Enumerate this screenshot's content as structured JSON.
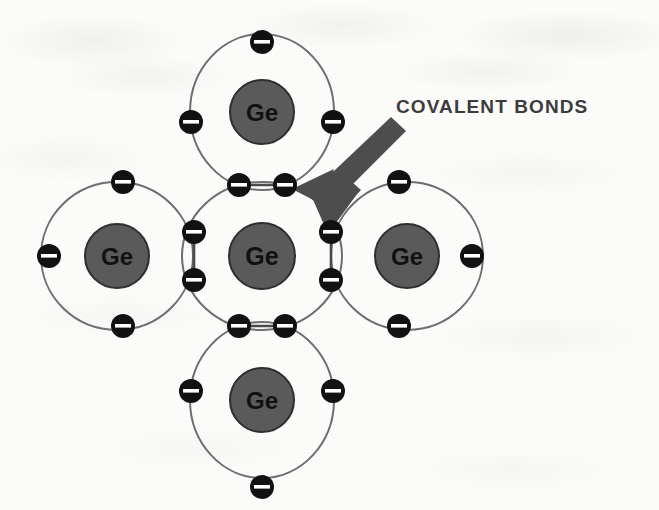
{
  "figure": {
    "annotation_label": "COVALENT BONDS",
    "element_symbol": "Ge",
    "background_color": "#fbfbfa",
    "nucleus_color": "#5a5a5a",
    "nucleus_stroke_color": "#2a2a2a",
    "orbit_color": "#6e6e6e",
    "electron_color": "#111111",
    "electron_sign_color": "#ffffff",
    "arrow_color": "#4d4d4d",
    "label_color": "#3c3c3c"
  },
  "atoms": [
    {
      "id": "center",
      "symbol": "Ge",
      "cx": 262,
      "cy": 256,
      "rx": 80,
      "ry": 74,
      "nucleus_r": 33,
      "position_name": "center-atom"
    },
    {
      "id": "top",
      "symbol": "Ge",
      "cx": 262,
      "cy": 112,
      "rx": 72,
      "ry": 78,
      "nucleus_r": 32,
      "position_name": "top-atom"
    },
    {
      "id": "bottom",
      "symbol": "Ge",
      "cx": 262,
      "cy": 400,
      "rx": 72,
      "ry": 78,
      "nucleus_r": 32,
      "position_name": "bottom-atom"
    },
    {
      "id": "left",
      "symbol": "Ge",
      "cx": 117,
      "cy": 256,
      "rx": 76,
      "ry": 74,
      "nucleus_r": 32,
      "position_name": "left-atom"
    },
    {
      "id": "right",
      "symbol": "Ge",
      "cx": 407,
      "cy": 256,
      "rx": 76,
      "ry": 74,
      "nucleus_r": 32,
      "position_name": "right-atom"
    }
  ],
  "electrons": [
    {
      "id": "e-center-top-left",
      "cx": 239,
      "cy": 185,
      "r": 12,
      "belongs_to": "center",
      "shared": true,
      "bond": "center-top",
      "charge": "-"
    },
    {
      "id": "e-top-bottom-right",
      "cx": 285,
      "cy": 185,
      "r": 12,
      "belongs_to": "top",
      "shared": true,
      "bond": "center-top",
      "charge": "-"
    },
    {
      "id": "e-center-bottom-left",
      "cx": 239,
      "cy": 326,
      "r": 12,
      "belongs_to": "center",
      "shared": true,
      "bond": "center-bottom",
      "charge": "-"
    },
    {
      "id": "e-bottom-top-right",
      "cx": 285,
      "cy": 326,
      "r": 12,
      "belongs_to": "bottom",
      "shared": true,
      "bond": "center-bottom",
      "charge": "-"
    },
    {
      "id": "e-center-left-top",
      "cx": 194,
      "cy": 232,
      "r": 12,
      "belongs_to": "center",
      "shared": true,
      "bond": "center-left",
      "charge": "-"
    },
    {
      "id": "e-left-right-bottom",
      "cx": 194,
      "cy": 280,
      "r": 12,
      "belongs_to": "left",
      "shared": true,
      "bond": "center-left",
      "charge": "-"
    },
    {
      "id": "e-center-right-top",
      "cx": 331,
      "cy": 232,
      "r": 12,
      "belongs_to": "center",
      "shared": true,
      "bond": "center-right",
      "charge": "-"
    },
    {
      "id": "e-right-left-bottom",
      "cx": 331,
      "cy": 280,
      "r": 12,
      "belongs_to": "right",
      "shared": true,
      "bond": "center-right",
      "charge": "-"
    },
    {
      "id": "e-top-north",
      "cx": 262,
      "cy": 42,
      "r": 12,
      "belongs_to": "top",
      "shared": false,
      "bond": null,
      "charge": "-"
    },
    {
      "id": "e-top-west",
      "cx": 191,
      "cy": 122,
      "r": 12,
      "belongs_to": "top",
      "shared": false,
      "bond": null,
      "charge": "-"
    },
    {
      "id": "e-top-east",
      "cx": 333,
      "cy": 122,
      "r": 12,
      "belongs_to": "top",
      "shared": false,
      "bond": null,
      "charge": "-"
    },
    {
      "id": "e-bottom-south",
      "cx": 262,
      "cy": 487,
      "r": 12,
      "belongs_to": "bottom",
      "shared": false,
      "bond": null,
      "charge": "-"
    },
    {
      "id": "e-bottom-west",
      "cx": 191,
      "cy": 391,
      "r": 12,
      "belongs_to": "bottom",
      "shared": false,
      "bond": null,
      "charge": "-"
    },
    {
      "id": "e-bottom-east",
      "cx": 333,
      "cy": 391,
      "r": 12,
      "belongs_to": "bottom",
      "shared": false,
      "bond": null,
      "charge": "-"
    },
    {
      "id": "e-left-north",
      "cx": 123,
      "cy": 182,
      "r": 12,
      "belongs_to": "left",
      "shared": false,
      "bond": null,
      "charge": "-"
    },
    {
      "id": "e-left-west",
      "cx": 49,
      "cy": 256,
      "r": 12,
      "belongs_to": "left",
      "shared": false,
      "bond": null,
      "charge": "-"
    },
    {
      "id": "e-left-south",
      "cx": 123,
      "cy": 326,
      "r": 12,
      "belongs_to": "left",
      "shared": false,
      "bond": null,
      "charge": "-"
    },
    {
      "id": "e-right-north",
      "cx": 399,
      "cy": 182,
      "r": 12,
      "belongs_to": "right",
      "shared": false,
      "bond": null,
      "charge": "-"
    },
    {
      "id": "e-right-east",
      "cx": 472,
      "cy": 256,
      "r": 12,
      "belongs_to": "right",
      "shared": false,
      "bond": null,
      "charge": "-"
    },
    {
      "id": "e-right-south",
      "cx": 399,
      "cy": 326,
      "r": 12,
      "belongs_to": "right",
      "shared": false,
      "bond": null,
      "charge": "-"
    }
  ],
  "bond_links": [
    {
      "id": "link-top",
      "x1": 239,
      "y1": 185,
      "x2": 285,
      "y2": 185
    },
    {
      "id": "link-bottom",
      "x1": 239,
      "y1": 326,
      "x2": 285,
      "y2": 326
    },
    {
      "id": "link-left",
      "x1": 194,
      "y1": 232,
      "x2": 194,
      "y2": 280
    },
    {
      "id": "link-right",
      "x1": 331,
      "y1": 232,
      "x2": 331,
      "y2": 280
    }
  ],
  "annotation": {
    "label": "COVALENT BONDS",
    "label_x": 396,
    "label_y": 96,
    "arrow_tail_x": 392,
    "arrow_tail_y": 116,
    "arrow_head_1_target": "e-center-top-left-pair",
    "arrow_head_2_target": "e-center-right-top"
  }
}
